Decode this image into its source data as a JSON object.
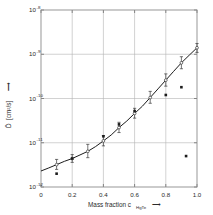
{
  "chart_data": {
    "type": "scatter",
    "title": "",
    "xlabel": "Mass fraction c",
    "xlabel_subscript": "HgTe",
    "xlabel_arrow": "⟶",
    "ylabel_symbol": "D̃",
    "ylabel_units": "[cm²/s]",
    "ylabel_arrow": "⟶",
    "xlim": [
      0,
      1.0
    ],
    "ylim": [
      1e-12,
      1e-08
    ],
    "yscale": "log",
    "xscale": "linear",
    "grid": true,
    "legend": "none",
    "xticks": [
      "0",
      "0.2",
      "0.4",
      "0.6",
      "0.8",
      "1.0"
    ],
    "xtick_values": [
      0,
      0.2,
      0.4,
      0.6,
      0.8,
      1.0
    ],
    "ytick_labels": [
      {
        "mantissa": "10",
        "exponent": "-8",
        "value": 1e-08
      },
      {
        "mantissa": "10",
        "exponent": "-9",
        "value": 1e-09
      },
      {
        "mantissa": "10",
        "exponent": "-10",
        "value": 1e-10
      },
      {
        "mantissa": "10",
        "exponent": "-11",
        "value": 1e-11
      },
      {
        "mantissa": "10",
        "exponent": "-12",
        "value": 1e-12
      }
    ],
    "series": [
      {
        "name": "interdiffusion-coefficient-curve",
        "marker": "line",
        "x": [
          0.0,
          0.05,
          0.1,
          0.15,
          0.2,
          0.25,
          0.3,
          0.35,
          0.4,
          0.45,
          0.5,
          0.55,
          0.6,
          0.65,
          0.7,
          0.75,
          0.8,
          0.85,
          0.9,
          0.95,
          1.0
        ],
        "y": [
          2.3e-12,
          2.7e-12,
          3.2e-12,
          3.8e-12,
          4.4e-12,
          5.3e-12,
          6.4e-12,
          8.2e-12,
          1.1e-11,
          1.5e-11,
          2.2e-11,
          3.1e-11,
          4.6e-11,
          6.7e-11,
          1.05e-10,
          1.65e-10,
          2.6e-10,
          4.1e-10,
          6.4e-10,
          9.5e-10,
          1.4e-09
        ]
      },
      {
        "name": "measured-points-with-error-bars",
        "marker": "open-circle",
        "x": [
          0.1,
          0.2,
          0.3,
          0.4,
          0.5,
          0.6,
          0.7,
          0.8,
          0.9,
          1.0
        ],
        "y": [
          3.2e-12,
          4.4e-12,
          6.4e-12,
          1.1e-11,
          2.2e-11,
          4.6e-11,
          1.05e-10,
          2.6e-10,
          6.4e-10,
          1.4e-09
        ],
        "yerr_upper": [
          4.2e-12,
          5.4e-12,
          9.2e-12,
          1.45e-11,
          2.9e-11,
          6e-11,
          1.45e-10,
          3.6e-10,
          8.8e-10,
          1.75e-09
        ],
        "yerr_lower": [
          2.5e-12,
          3.6e-12,
          4.6e-12,
          8.5e-12,
          1.7e-11,
          3.6e-11,
          7.8e-11,
          1.9e-10,
          4.7e-10,
          1.1e-09
        ]
      },
      {
        "name": "secondary-points",
        "marker": "filled-square",
        "x": [
          0.1,
          0.2,
          0.4,
          0.5,
          0.6,
          0.8,
          0.9,
          0.93
        ],
        "y": [
          2e-12,
          4.4e-12,
          1.4e-11,
          2.6e-11,
          5.2e-11,
          1.2e-10,
          1.8e-10,
          5e-12
        ]
      }
    ]
  },
  "geometry": {
    "plot_left": 41,
    "plot_right": 197,
    "plot_top": 10,
    "plot_bottom": 187
  },
  "colors": {
    "background": "#ffffff",
    "frame": "#8c8c8c",
    "grid": "#b4b4b4",
    "curve": "#1c1c1c",
    "marker_fill": "#1c1c1c",
    "text": "#2b2b2b"
  }
}
